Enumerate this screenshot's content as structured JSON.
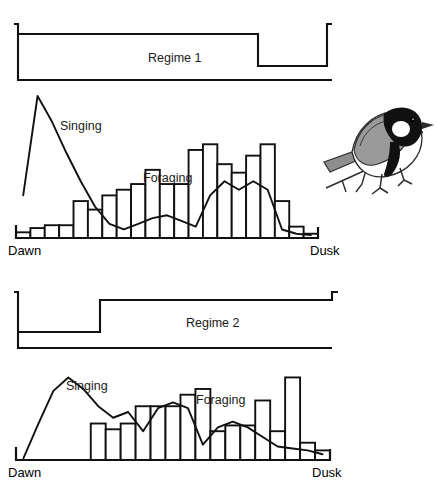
{
  "figure": {
    "width": 436,
    "height": 481,
    "background": "#ffffff",
    "ink_color": "#111111",
    "illustration": {
      "name": "great-tit-bird-on-branch",
      "x": 322,
      "y": 96,
      "width": 108,
      "height": 104
    }
  },
  "panels": [
    {
      "id": "panel-1",
      "regime": {
        "label": "Regime 1",
        "label_x": 148,
        "label_y": 62,
        "description": "light phase first, dark phase at end of day",
        "trace": {
          "x_left": 18,
          "x_right": 332,
          "y_high": 34,
          "y_low": 66,
          "y_floor": 80,
          "lead_tick_y": 24,
          "step_down_x": 258,
          "step_up_x": 327
        }
      },
      "axis": {
        "dawn": "Dawn",
        "dusk": "Dusk",
        "baseline_y": 238,
        "x_left": 16,
        "x_right": 318
      },
      "series_labels": [
        {
          "text": "Singing",
          "x": 60,
          "y": 130
        },
        {
          "text": "Foraging",
          "x": 143,
          "y": 182
        }
      ],
      "chart_data": {
        "type": "bar",
        "title": "Regime 1 daily activity",
        "xlabel": "Time of day",
        "ylabel": "Activity",
        "x": [
          "Dawn",
          "",
          "",
          "",
          "",
          "",
          "",
          "",
          "",
          "",
          "",
          "",
          "",
          "",
          "",
          "",
          "",
          "",
          "",
          "Dusk"
        ],
        "ylim": [
          0,
          100
        ],
        "series": [
          {
            "name": "Foraging",
            "kind": "bar",
            "values": [
              4,
              7,
              9,
              9,
              26,
              20,
              30,
              34,
              38,
              48,
              38,
              38,
              62,
              66,
              52,
              46,
              58,
              66,
              26,
              8,
              3
            ]
          },
          {
            "name": "Singing",
            "kind": "line",
            "values": [
              30,
              100,
              82,
              60,
              40,
              22,
              10,
              6,
              10,
              14,
              16,
              12,
              8,
              30,
              40,
              34,
              40,
              34,
              6,
              3,
              2
            ]
          }
        ]
      }
    },
    {
      "id": "panel-2",
      "regime": {
        "label": "Regime 2",
        "label_x": 186,
        "label_y": 327,
        "description": "dark phase first, light phase for rest of day",
        "trace": {
          "x_left": 18,
          "x_right": 332,
          "y_high": 300,
          "y_low": 332,
          "y_floor": 348,
          "lead_tick_y": 292,
          "step_up_x": 100
        }
      },
      "axis": {
        "dawn": "Dawn",
        "dusk": "Dusk",
        "baseline_y": 460,
        "x_left": 16,
        "x_right": 330
      },
      "series_labels": [
        {
          "text": "Singing",
          "x": 66,
          "y": 390
        },
        {
          "text": "Foraging",
          "x": 196,
          "y": 404
        }
      ],
      "chart_data": {
        "type": "bar",
        "title": "Regime 2 daily activity",
        "xlabel": "Time of day",
        "ylabel": "Activity",
        "x": [
          "Dawn",
          "",
          "",
          "",
          "",
          "",
          "",
          "",
          "",
          "",
          "",
          "",
          "",
          "",
          "",
          "",
          "",
          "",
          "",
          "Dusk"
        ],
        "ylim": [
          0,
          100
        ],
        "series": [
          {
            "name": "Foraging",
            "kind": "bar",
            "values": [
              0,
              0,
              0,
              0,
              0,
              38,
              32,
              38,
              56,
              56,
              56,
              68,
              74,
              30,
              36,
              36,
              62,
              30,
              86,
              18,
              10
            ]
          },
          {
            "name": "Singing",
            "kind": "line",
            "values": [
              2,
              38,
              72,
              86,
              74,
              56,
              44,
              50,
              30,
              54,
              60,
              54,
              16,
              34,
              40,
              34,
              24,
              14,
              12,
              10,
              6
            ]
          }
        ]
      }
    }
  ]
}
